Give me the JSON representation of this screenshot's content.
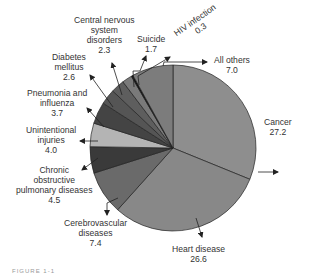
{
  "chart_data": {
    "type": "pie",
    "title": "",
    "unit": "percent",
    "categories": [
      "Cancer",
      "Heart disease",
      "Cerebrovascular diseases",
      "Chronic obstructive pulmonary diseases",
      "Unintentional injuries",
      "Pneumonia and influenza",
      "Diabetes mellitus",
      "Central nervous system disorders",
      "Suicide",
      "HIV infection",
      "All others"
    ],
    "values": [
      27.2,
      26.6,
      7.4,
      4.5,
      4.0,
      3.7,
      2.6,
      2.3,
      1.7,
      0.3,
      7.0
    ],
    "colors": [
      "#8e8e8e",
      "#888888",
      "#6a6a6a",
      "#3a3a3a",
      "#b4b4b4",
      "#444444",
      "#555555",
      "#5e5e5e",
      "#7a7a7a",
      "#111111",
      "#7c7c7c"
    ],
    "start_angle_deg": 0,
    "direction": "clockwise",
    "legend": "none (callout labels)"
  },
  "labels": [
    {
      "name": "Cancer",
      "lines": [
        "Cancer",
        "27.2"
      ]
    },
    {
      "name": "Heart disease",
      "lines": [
        "Heart disease",
        "26.6"
      ]
    },
    {
      "name": "Cerebrovascular diseases",
      "lines": [
        "Cerebrovascular",
        "diseases",
        "7.4"
      ]
    },
    {
      "name": "Chronic obstructive pulmonary diseases",
      "lines": [
        "Chronic",
        "obstructive",
        "pulmonary diseases",
        "4.5"
      ]
    },
    {
      "name": "Unintentional injuries",
      "lines": [
        "Unintentional",
        "injuries",
        "4.0"
      ]
    },
    {
      "name": "Pneumonia and influenza",
      "lines": [
        "Pneumonia and",
        "influenza",
        "3.7"
      ]
    },
    {
      "name": "Diabetes mellitus",
      "lines": [
        "Diabetes",
        "mellitus",
        "2.6"
      ]
    },
    {
      "name": "Central nervous system disorders",
      "lines": [
        "Central nervous",
        "system",
        "disorders",
        "2.3"
      ]
    },
    {
      "name": "Suicide",
      "lines": [
        "Suicide",
        "1.7"
      ]
    },
    {
      "name": "HIV infection",
      "lines": [
        "HIV infection",
        "0.3"
      ]
    },
    {
      "name": "All others",
      "lines": [
        "All others",
        "7.0"
      ]
    }
  ],
  "caption": "FIGURE 1-1"
}
